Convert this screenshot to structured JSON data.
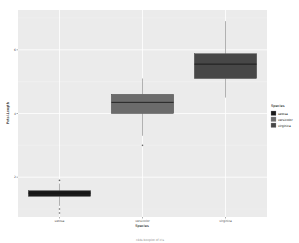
{
  "chart_data": {
    "type": "box",
    "title": "",
    "xlabel": "Species",
    "ylabel": "Petal.Length",
    "categories": [
      "setosa",
      "versicolor",
      "virginica"
    ],
    "y_ticks": [
      2,
      4,
      6
    ],
    "ylim": [
      0.75,
      7.25
    ],
    "grid": true,
    "legend": {
      "title": "Species",
      "position": "right",
      "entries": [
        {
          "label": "setosa",
          "color": "#1a1a1a"
        },
        {
          "label": "versicolor",
          "color": "#6b6b6b"
        },
        {
          "label": "virginica",
          "color": "#474747"
        }
      ]
    },
    "series": [
      {
        "name": "setosa",
        "q1": 1.4,
        "median": 1.5,
        "q3": 1.575,
        "whisker_low": 1.1,
        "whisker_high": 1.8,
        "outliers": [
          1.9,
          1.0,
          1.0
        ]
      },
      {
        "name": "versicolor",
        "q1": 4.0,
        "median": 4.35,
        "q3": 4.6,
        "whisker_low": 3.3,
        "whisker_high": 5.1,
        "outliers": [
          3.0
        ]
      },
      {
        "name": "virginica",
        "q1": 5.1,
        "median": 5.55,
        "q3": 5.875,
        "whisker_low": 4.5,
        "whisker_high": 6.9,
        "outliers": []
      }
    ],
    "caption": "r4ds boxplot of iris"
  },
  "colors": {
    "panel_bg": "#ebebeb",
    "grid": "#ffffff",
    "box_outline": "#333333",
    "whisker": "#7f7f7f"
  }
}
